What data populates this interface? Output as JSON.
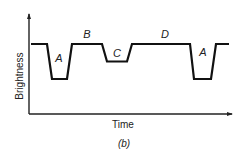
{
  "chart_data": {
    "type": "line",
    "title": "",
    "caption": "(b)",
    "xlabel": "Time",
    "ylabel": "Brightness",
    "grid": false,
    "levels": {
      "high": 1.0,
      "C_dip": 0.5,
      "A_dip": 0.0
    },
    "segments": [
      {
        "label": "",
        "level": "high"
      },
      {
        "label": "A",
        "level": "A_dip"
      },
      {
        "label": "B",
        "level": "high"
      },
      {
        "label": "C",
        "level": "C_dip"
      },
      {
        "label": "D",
        "level": "high"
      },
      {
        "label": "A",
        "level": "A_dip"
      },
      {
        "label": "",
        "level": "high"
      }
    ],
    "segment_labels": [
      "A",
      "B",
      "C",
      "D",
      "A"
    ]
  },
  "colors": {
    "line": "#111111",
    "axis": "#222222",
    "text": "#222222"
  }
}
